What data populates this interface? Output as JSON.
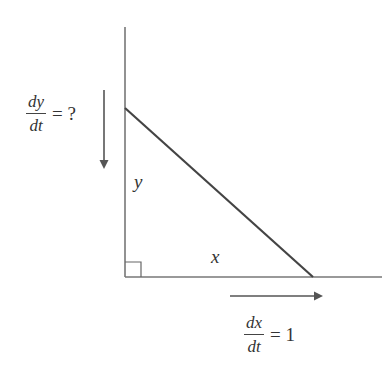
{
  "diagram": {
    "type": "related-rates-right-triangle",
    "labels": {
      "vertical_side": "y",
      "horizontal_side": "x"
    },
    "rate_y": {
      "numerator": "dy",
      "denominator": "dt",
      "rhs": "= ?"
    },
    "rate_x": {
      "numerator": "dx",
      "denominator": "dt",
      "rhs": "= 1"
    },
    "colors": {
      "line": "#444444",
      "axis": "#777777",
      "text": "#333333"
    }
  }
}
